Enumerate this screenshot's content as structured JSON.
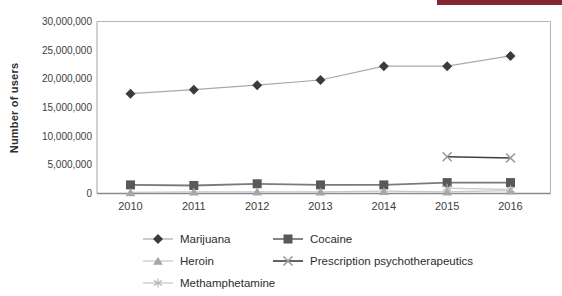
{
  "accent_bar": {
    "color": "#862633"
  },
  "chart_data": {
    "type": "line",
    "title": "",
    "xlabel": "",
    "ylabel": "Number of users",
    "categories": [
      "2010",
      "2011",
      "2012",
      "2013",
      "2014",
      "2015",
      "2016"
    ],
    "ylim": [
      0,
      30000000
    ],
    "y_tick_interval": 5000000,
    "y_tick_labels": [
      "0",
      "5,000,000",
      "10,000,000",
      "15,000,000",
      "20,000,000",
      "25,000,000",
      "30,000,000"
    ],
    "grid": false,
    "legend_position": "bottom",
    "series": [
      {
        "name": "Marijuana",
        "marker": "diamond",
        "marker_color": "#3b3b3b",
        "line_color": "#a9a9a9",
        "line_width": 1.2,
        "values": [
          17400000,
          18100000,
          18900000,
          19800000,
          22200000,
          22200000,
          24000000
        ]
      },
      {
        "name": "Cocaine",
        "marker": "square",
        "marker_color": "#595959",
        "line_color": "#7a7a7a",
        "line_width": 1.8,
        "values": [
          1500000,
          1400000,
          1700000,
          1500000,
          1500000,
          1900000,
          1900000
        ]
      },
      {
        "name": "Heroin",
        "marker": "triangle",
        "marker_color": "#a6a6a6",
        "line_color": "#c6c6c6",
        "line_width": 1.2,
        "values": [
          200000,
          300000,
          300000,
          300000,
          400000,
          300000,
          500000
        ]
      },
      {
        "name": "Prescription psychotherapeutics",
        "marker": "x",
        "marker_color": "#9a9a9a",
        "line_color": "#3f3f3f",
        "line_width": 1.6,
        "values": [
          null,
          null,
          null,
          null,
          null,
          6400000,
          6200000
        ]
      },
      {
        "name": "Methamphetamine",
        "marker": "asterisk",
        "marker_color": "#b2b2b2",
        "line_color": "#cfcfcf",
        "line_width": 1.5,
        "values": [
          null,
          null,
          null,
          null,
          null,
          900000,
          700000
        ]
      }
    ]
  },
  "legend": {
    "column1": [
      0,
      2,
      4
    ],
    "column2": [
      1,
      3
    ]
  }
}
